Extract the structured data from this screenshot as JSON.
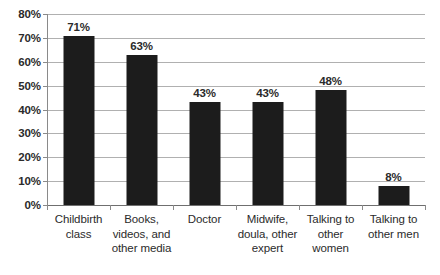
{
  "chart_data": {
    "type": "bar",
    "title": "",
    "subtitle": "",
    "xlabel": "",
    "ylabel": "",
    "ylim": [
      0,
      80
    ],
    "grid": true,
    "legend": false,
    "orientation": "vertical",
    "bar_color": "#1c1c1c",
    "gridline_color": "#b0b0b0",
    "background_color": "#ffffff",
    "categories": [
      "Childbirth class",
      "Books, videos, and other media",
      "Doctor",
      "Midwife, doula, other expert",
      "Talking to other women",
      "Talking to other men"
    ],
    "category_lines": [
      [
        "Childbirth",
        "class"
      ],
      [
        "Books,",
        "videos, and",
        "other media"
      ],
      [
        "Doctor"
      ],
      [
        "Midwife,",
        "doula, other",
        "expert"
      ],
      [
        "Talking to",
        "other",
        "women"
      ],
      [
        "Talking to",
        "other men"
      ]
    ],
    "values": [
      71,
      63,
      43,
      43,
      48,
      8
    ],
    "data_labels": [
      "71%",
      "63%",
      "43%",
      "43%",
      "48%",
      "8%"
    ],
    "y_ticks": [
      0,
      10,
      20,
      30,
      40,
      50,
      60,
      70,
      80
    ],
    "y_tick_labels": [
      "0%",
      "10%",
      "20%",
      "30%",
      "40%",
      "50%",
      "60%",
      "70%",
      "80%"
    ]
  }
}
